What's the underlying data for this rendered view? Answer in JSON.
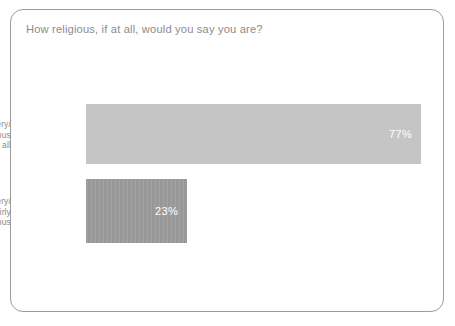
{
  "card": {
    "title": "How religious, if at all, would you say you are?",
    "border_color": "#9d9d9d",
    "background_color": "#ffffff",
    "title_color": "#8c8c8c"
  },
  "chart_data": {
    "type": "bar",
    "orientation": "horizontal",
    "title": "How religious, if at all, would you say you are?",
    "xlabel": "",
    "ylabel": "",
    "xlim": [
      0,
      100
    ],
    "grid": false,
    "legend": null,
    "categories": [
      "Not very/ not religious at all",
      "Very/ fairly religious"
    ],
    "values": [
      77,
      23
    ],
    "value_labels": [
      "77%",
      "23%"
    ],
    "value_label_color": "#ffffff",
    "bar_colors": [
      "#c5c5c5",
      "#9a9a9a"
    ],
    "tick_label_color": "#8c8c8c"
  },
  "bars": [
    {
      "key": "not-religious",
      "label_lines": [
        "Not very/",
        "not religious",
        "at all"
      ],
      "value_label": "77%",
      "value": 77,
      "color": "#c5c5c5"
    },
    {
      "key": "religious",
      "label_lines": [
        "Very/",
        "fairly",
        "religious"
      ],
      "value_label": "23%",
      "value": 23,
      "color": "#9a9a9a"
    }
  ]
}
